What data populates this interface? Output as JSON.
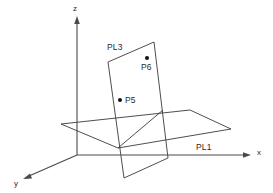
{
  "figure": {
    "background_color": "#ffffff",
    "line_color": "#3a3a3a",
    "axis_color": "#4a4a4a",
    "point_color": "#111111"
  },
  "axes": [
    {
      "id": "x",
      "label": "x",
      "label_x": 257,
      "label_y": 155,
      "direction": "right"
    },
    {
      "id": "y",
      "label": "y",
      "label_x": 14,
      "label_y": 186,
      "direction": "down-left"
    },
    {
      "id": "z",
      "label": "z",
      "label_x": 73,
      "label_y": 11,
      "direction": "up"
    }
  ],
  "planes": [
    {
      "id": "PL1",
      "label": "PL1",
      "label_x": 196,
      "label_y": 150,
      "orientation": "horizontal"
    },
    {
      "id": "PL3",
      "label": "PL3",
      "label_x": 107,
      "label_y": 50,
      "orientation": "tilted-vertical"
    }
  ],
  "points": [
    {
      "id": "P5",
      "label": "P5",
      "dot_x": 120,
      "dot_y": 100,
      "label_x": 125,
      "label_y": 103
    },
    {
      "id": "P6",
      "label": "P6",
      "dot_x": 147,
      "dot_y": 58,
      "label_x": 141,
      "label_y": 70
    }
  ],
  "origin": {
    "x": 77,
    "y": 155
  }
}
